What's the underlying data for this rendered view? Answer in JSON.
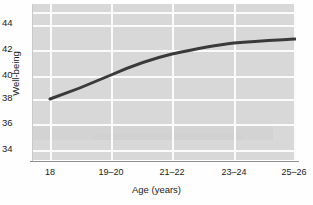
{
  "chart_data": {
    "type": "line",
    "title": "",
    "xlabel": "Age (years)",
    "ylabel": "Well-being",
    "categories": [
      "18",
      "19–20",
      "21–22",
      "23–24",
      "25–26"
    ],
    "x": [
      0,
      1,
      2,
      3,
      4
    ],
    "values": [
      38.2,
      39.3,
      40.0,
      40.5,
      40.7
    ],
    "series": [
      {
        "name": "Well-being",
        "values": [
          38.2,
          39.3,
          40.0,
          40.5,
          40.7
        ]
      }
    ],
    "ylim": [
      33,
      45
    ],
    "yticks": [
      34,
      36,
      38,
      40,
      42,
      44
    ],
    "ytick_labels": [
      "34",
      "36",
      "38",
      "40",
      "42",
      "44"
    ],
    "grid": true,
    "grid_color": "#fbfbfb",
    "plot_background": "#d8d8d8",
    "line_color": "#3a3a3a",
    "line_width": 3,
    "legend": "none",
    "markers": "none",
    "smoothing": "curved"
  },
  "axes": {
    "y_ticks": [
      {
        "label": "44",
        "value": 44,
        "top": 17
      },
      {
        "label": "42",
        "value": 42,
        "top": 43
      },
      {
        "label": "40",
        "value": 40,
        "top": 69
      },
      {
        "label": "38",
        "value": 38,
        "top": 92
      },
      {
        "label": "36",
        "value": 36,
        "top": 117
      },
      {
        "label": "34",
        "value": 34,
        "top": 143
      }
    ],
    "x_ticks": [
      {
        "label": "18",
        "left": 50
      },
      {
        "label": "19–20",
        "left": 111
      },
      {
        "label": "21–22",
        "left": 172
      },
      {
        "label": "23–24",
        "left": 234
      },
      {
        "label": "25–26",
        "left": 294
      }
    ],
    "x_axis_label": "Age (years)",
    "y_axis_label": "Well-being"
  },
  "gridlines": {
    "horizontal_tops": [
      8,
      21,
      46,
      72,
      95,
      120,
      146
    ],
    "vertical_lefts": [
      17,
      78,
      139,
      201,
      261
    ]
  },
  "series_path": "M 17 95 C 40 87, 62 78, 78 71 C 96 63, 118 55, 139 50 C 162 45, 183 41, 201 39 C 223 37, 245 36, 262 35"
}
